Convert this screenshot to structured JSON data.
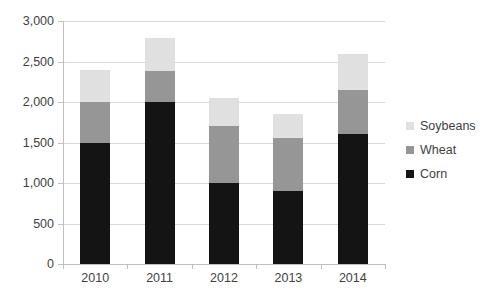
{
  "chart_data": {
    "type": "bar",
    "subtype": "stacked-bar",
    "title": "",
    "xlabel": "",
    "ylabel": "",
    "categories": [
      "2010",
      "2011",
      "2012",
      "2013",
      "2014"
    ],
    "series": [
      {
        "name": "Corn",
        "color": "#141414",
        "values": [
          1500,
          2000,
          1000,
          900,
          1600
        ]
      },
      {
        "name": "Wheat",
        "color": "#969696",
        "values": [
          500,
          380,
          700,
          650,
          550
        ]
      },
      {
        "name": "Soybeans",
        "color": "#e0e0e0",
        "values": [
          400,
          410,
          350,
          300,
          440
        ]
      }
    ],
    "stack_totals": [
      2400,
      2790,
      2050,
      1850,
      2590
    ],
    "ylim": [
      0,
      3000
    ],
    "ytick_values": [
      0,
      500,
      1000,
      1500,
      2000,
      2500,
      3000
    ],
    "ytick_labels": [
      "0",
      "500",
      "1,000",
      "1,500",
      "2,000",
      "2,500",
      "3,000"
    ],
    "grid": true,
    "legend_position": "right",
    "legend_entries": [
      "Soybeans",
      "Wheat",
      "Corn"
    ],
    "colors": {
      "gridline": "#d9d9d9",
      "axis": "#bfbfbf",
      "text": "#3f3f3f",
      "background": "#ffffff"
    }
  }
}
